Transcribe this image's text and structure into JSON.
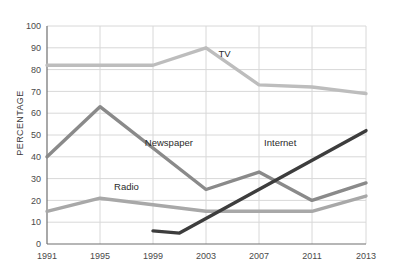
{
  "chart_data": {
    "type": "line",
    "title": "",
    "xlabel": "",
    "ylabel": "PERCENTAGE",
    "x": [
      1991,
      1995,
      1999,
      2001,
      2003,
      2007,
      2011,
      2013
    ],
    "xticks": [
      "1991",
      "1995",
      "1999",
      "2003",
      "2007",
      "2011",
      "2013"
    ],
    "yticks": [
      "0",
      "10",
      "20",
      "30",
      "40",
      "50",
      "60",
      "70",
      "80",
      "90",
      "100"
    ],
    "xlim": [
      1991,
      2013
    ],
    "ylim": [
      0,
      100
    ],
    "grid": true,
    "legend": "inline-labels",
    "series": [
      {
        "name": "TV",
        "color": "#bdbdbd",
        "label_x": 2004.4,
        "label_y": 86,
        "points": [
          {
            "x": 1991,
            "y": 82
          },
          {
            "x": 1995,
            "y": 82
          },
          {
            "x": 1999,
            "y": 82
          },
          {
            "x": 2003,
            "y": 90
          },
          {
            "x": 2007,
            "y": 73
          },
          {
            "x": 2011,
            "y": 72
          },
          {
            "x": 2013,
            "y": 69
          }
        ]
      },
      {
        "name": "Newspaper",
        "color": "#8a8a8a",
        "label_x": 2000.2,
        "label_y": 45,
        "points": [
          {
            "x": 1991,
            "y": 40
          },
          {
            "x": 1995,
            "y": 63
          },
          {
            "x": 2003,
            "y": 25
          },
          {
            "x": 2007,
            "y": 33
          },
          {
            "x": 2011,
            "y": 20
          },
          {
            "x": 2013,
            "y": 28
          }
        ]
      },
      {
        "name": "Radio",
        "color": "#a8a8a8",
        "label_x": 1997.0,
        "label_y": 25,
        "points": [
          {
            "x": 1991,
            "y": 15
          },
          {
            "x": 1995,
            "y": 21
          },
          {
            "x": 1999,
            "y": 18
          },
          {
            "x": 2003,
            "y": 15
          },
          {
            "x": 2007,
            "y": 15
          },
          {
            "x": 2011,
            "y": 15
          },
          {
            "x": 2013,
            "y": 22
          }
        ]
      },
      {
        "name": "Internet",
        "color": "#3d3d3d",
        "label_x": 2008.6,
        "label_y": 45,
        "points": [
          {
            "x": 1999,
            "y": 6
          },
          {
            "x": 2001,
            "y": 5
          },
          {
            "x": 2013,
            "y": 52
          }
        ]
      }
    ]
  },
  "colors": {
    "axis": "#6f6f6f",
    "grid": "#d8d8d8",
    "background": "#ffffff",
    "tick_text": "#4a4a4a"
  }
}
